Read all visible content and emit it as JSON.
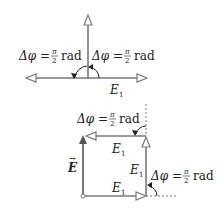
{
  "diagram": {
    "top": {
      "left_label": {
        "delta": "Δφ",
        "eq": "=",
        "num": "π",
        "den": "2",
        "unit": "rad"
      },
      "right_label": {
        "delta": "Δφ",
        "eq": "=",
        "num": "π",
        "den": "2",
        "unit": "rad"
      },
      "vector_label": {
        "base": "E",
        "sub": "1"
      }
    },
    "bottom": {
      "top_angle_label": {
        "delta": "Δφ",
        "eq": "=",
        "num": "π",
        "den": "2",
        "unit": "rad"
      },
      "right_angle_label": {
        "delta": "Δφ",
        "eq": "=",
        "num": "π",
        "den": "2",
        "unit": "rad"
      },
      "top_vector_label": {
        "base": "E",
        "sub": "1"
      },
      "right_vector_label": {
        "base": "E",
        "sub": "1"
      },
      "bottom_vector_label": {
        "base": "E",
        "sub": "1"
      },
      "resultant_label": {
        "base": "E",
        "arrow": "→"
      }
    },
    "colors": {
      "vector": "#7a7a7a",
      "text": "#222222"
    }
  }
}
